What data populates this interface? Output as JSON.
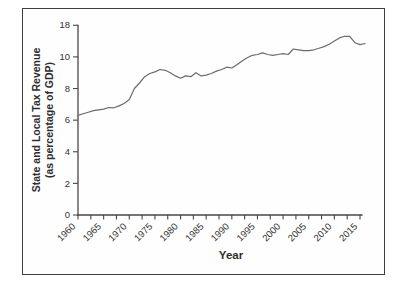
{
  "figure": {
    "background_color": "#ffffff",
    "frame_border_color": "#3f3f3f",
    "line_color": "#6b6b6b",
    "axis_color": "#474747",
    "text_color": "#333333"
  },
  "chart_data": {
    "type": "line",
    "title": "",
    "xlabel": "Year",
    "ylabel_line1": "State and Local Tax Revenue",
    "ylabel_line2": "(as percentage of GDP)",
    "x_range": [
      1960,
      2015
    ],
    "x_major_tick_labels": [
      "1960",
      "1965",
      "1970",
      "1975",
      "1980",
      "1985",
      "1990",
      "1995",
      "2000",
      "2005",
      "2010",
      "2015"
    ],
    "x_minor_tick_step_years": 2.5,
    "x_tick_label_rotation_deg": -45,
    "grid": "off",
    "legend": "none",
    "y_axis_ticks": [
      {
        "label": "0",
        "position": 0
      },
      {
        "label": "2",
        "position": 2
      },
      {
        "label": "4",
        "position": 4
      },
      {
        "label": "6",
        "position": 6
      },
      {
        "label": "8",
        "position": 8
      },
      {
        "label": "10",
        "position": 10
      },
      {
        "label": "18",
        "position": 12
      }
    ],
    "series": [
      {
        "name": "State and local tax revenue (% of GDP)",
        "x": [
          1960,
          1961,
          1962,
          1963,
          1964,
          1965,
          1966,
          1967,
          1968,
          1969,
          1970,
          1971,
          1972,
          1973,
          1974,
          1975,
          1976,
          1977,
          1978,
          1979,
          1980,
          1981,
          1982,
          1983,
          1984,
          1985,
          1986,
          1987,
          1988,
          1989,
          1990,
          1991,
          1992,
          1993,
          1994,
          1995,
          1996,
          1997,
          1998,
          1999,
          2000,
          2001,
          2002,
          2003,
          2004,
          2005,
          2006,
          2007,
          2008,
          2009,
          2010,
          2011,
          2012,
          2013,
          2014,
          2015,
          2016
        ],
        "y": [
          6.3,
          6.4,
          6.5,
          6.6,
          6.65,
          6.7,
          6.8,
          6.78,
          6.9,
          7.05,
          7.3,
          8.0,
          8.35,
          8.75,
          8.95,
          9.05,
          9.2,
          9.15,
          9.0,
          8.8,
          8.65,
          8.8,
          8.75,
          9.0,
          8.8,
          8.85,
          8.95,
          9.1,
          9.2,
          9.35,
          9.3,
          9.5,
          9.75,
          9.95,
          10.1,
          10.15,
          10.25,
          10.15,
          10.1,
          10.15,
          10.2,
          10.15,
          10.5,
          10.45,
          10.4,
          10.4,
          10.45,
          10.55,
          10.65,
          10.8,
          11.0,
          11.2,
          11.3,
          11.3,
          10.9,
          10.78,
          10.85
        ]
      }
    ]
  }
}
